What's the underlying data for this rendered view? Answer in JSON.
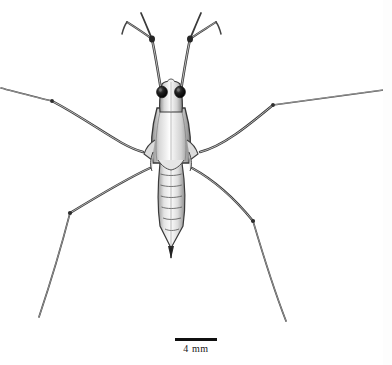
{
  "figure": {
    "medium": "pen-and-ink scientific illustration",
    "background_color": "#ffffff",
    "ink_color": "#2b2b2b",
    "eye_color": "#1a1a1a",
    "body_fill": "#efefef",
    "shading_color": "#9a9a9a"
  },
  "scale_bar": {
    "label": "4 mm",
    "value": 4,
    "unit": "mm",
    "bar_length_px": 42,
    "bar_color": "#101010"
  },
  "anatomy": {
    "head_label": "head",
    "eyes_label": "compound eyes",
    "thorax_label": "thorax",
    "abdomen_label": "abdomen",
    "abdomen_segments": 7,
    "foreleg_label": "foreleg",
    "midleg_label": "middle leg",
    "hindleg_label": "hind leg"
  }
}
